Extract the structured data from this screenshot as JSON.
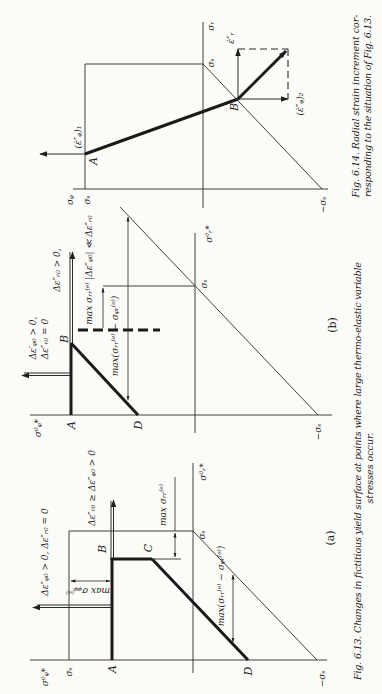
{
  "page": {
    "background": "#fbfbf8",
    "ink": "#1e1e1e",
    "orientation": "rotated 90° counter-clockwise"
  },
  "fig_6_14": {
    "labels": {
      "sigma_r_axis": "σᵣ",
      "sigma_s_top": "σₛ",
      "strain_rate_r": "ε̇″ᵣ",
      "point_b": "B",
      "strain_rate_phi_2": "(ε̇″ᵩ)₂",
      "strain_rate_phi_1": "(ε̇″ᵩ)₁",
      "point_a": "A",
      "sigma_phi_axis": "σᵩ",
      "sigma_s_left": "σₛ",
      "neg_sigma_s": "−σₛ"
    },
    "caption": {
      "line1": "Fig. 6.14. Radial strain increment cor-",
      "line2": "responding to the situation of Fig. 6.13."
    }
  },
  "fig_6_13": {
    "panel_b": {
      "panel_label": "(b)",
      "sigma_phi_star": "σ⁰ᵩ*",
      "sigma_r_star": "σ⁰ᵣ*",
      "sigma_s": "σₛ",
      "neg_sigma_s": "−σₛ",
      "point_a": "A",
      "point_b": "B",
      "point_d": "D",
      "cond_phi": "Δε′ᵩ₀ > 0,",
      "cond_r_zero": "Δε″ᵣ₀ = 0",
      "cond_r_pos": "Δε″ᵣ₀ > 0,",
      "max_rr_note": "max σᵣᵣ⁽ᵉ⁾ |Δε″ᵩ₀| ≪ Δε″ᵣ₀",
      "max_diff": "max(σᵣᵣ⁽ᵉ⁾ − σᵩᵣ⁽ᵉ⁾)"
    },
    "panel_a": {
      "panel_label": "(a)",
      "sigma_phi_star": "σ⁰ᵩ*",
      "sigma_r_star": "σ⁰ᵣ*",
      "sigma_s_left": "σₛ",
      "sigma_s_axis": "σₛ",
      "neg_sigma_s": "−σₛ",
      "point_a": "A",
      "point_b": "B",
      "point_c": "C",
      "point_d": "D",
      "cond_phi_r": "Δε″ᵩ₀ > 0, Δε″ᵣ₀ = 0",
      "cond_r_ge_phi": "Δε″ᵣ₀ ≥ Δε″ᵩ₀ > 0",
      "max_phiphi": "max σᵩᵩ⁽ᵉ⁾",
      "max_rr": "max σᵣᵣ⁽ᵉ⁾",
      "max_diff": "max(σᵣᵣ⁽ᵉ⁾ − σᵩᵣ⁽ᵉ⁾)"
    },
    "caption": {
      "line1": "Fig. 6.13. Changes in fictitious yield surface at points where large thermo-elastic variable",
      "line2": "stresses occur."
    }
  }
}
